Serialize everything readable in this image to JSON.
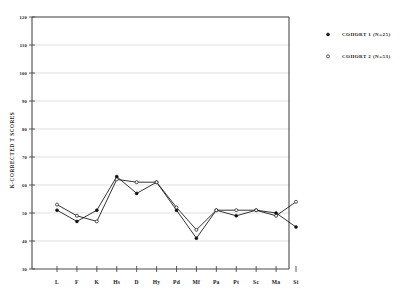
{
  "chart_data": {
    "type": "line",
    "title": "",
    "xlabel": "",
    "ylabel": "K-CORRECTED T SCORES",
    "categories": [
      "L",
      "F",
      "K",
      "Hs",
      "D",
      "Hy",
      "Pd",
      "Mf",
      "Pa",
      "Pt",
      "Sc",
      "Ma",
      "Si"
    ],
    "ylim": [
      30,
      120
    ],
    "ytick_labels": [
      "120",
      "110",
      "100",
      "90",
      "80",
      "70",
      "60",
      "50",
      "40",
      "30"
    ],
    "ytick_values": [
      120,
      110,
      100,
      90,
      80,
      70,
      60,
      50,
      40,
      30
    ],
    "grid": true,
    "legend_position": "right",
    "series": [
      {
        "name": "COHORT 1 (N=25)",
        "marker": "filled-circle",
        "values": [
          51,
          47,
          51,
          63,
          57,
          61,
          51,
          41,
          51,
          49,
          51,
          50,
          45
        ]
      },
      {
        "name": "COHORT 2 (N=53)",
        "marker": "open-circle",
        "values": [
          53,
          49,
          47,
          62,
          61,
          61,
          52,
          44,
          51,
          51,
          51,
          49,
          54
        ]
      }
    ]
  },
  "legend": {
    "entries": [
      {
        "label": "COHORT 1 (N=25)",
        "marker": "filled-circle"
      },
      {
        "label": "COHORT 2 (N=53)",
        "marker": "open-circle"
      }
    ]
  },
  "colors": {
    "axis": "#4a4a4a",
    "grid": "#c9c9c9",
    "series": "#101010",
    "background": "#ffffff"
  }
}
